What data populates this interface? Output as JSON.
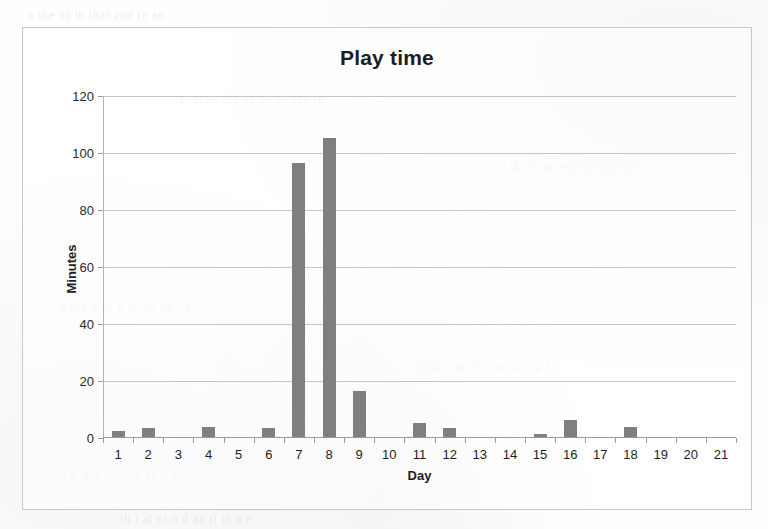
{
  "chart_data": {
    "type": "bar",
    "title": "Play time",
    "xlabel": "Day",
    "ylabel": "Minutes",
    "categories": [
      "1",
      "2",
      "3",
      "4",
      "5",
      "6",
      "7",
      "8",
      "9",
      "10",
      "11",
      "12",
      "13",
      "14",
      "15",
      "16",
      "17",
      "18",
      "19",
      "20",
      "21"
    ],
    "values": [
      2,
      3,
      0,
      3.5,
      0,
      3,
      96,
      105,
      16,
      0,
      5,
      3,
      0,
      0,
      1,
      6,
      0,
      3.5,
      0,
      0,
      0
    ],
    "ylim": [
      0,
      120
    ],
    "yticks": [
      0,
      20,
      40,
      60,
      80,
      100,
      120
    ],
    "ytick_labels": [
      "0",
      "20",
      "40",
      "60",
      "80",
      "100",
      "120"
    ],
    "grid": true,
    "legend": false,
    "legend_position": "none",
    "series": [
      {
        "name": "Play time",
        "color": "#7f7f7f",
        "values": [
          2,
          3,
          0,
          3.5,
          0,
          3,
          96,
          105,
          16,
          0,
          5,
          3,
          0,
          0,
          1,
          6,
          0,
          3.5,
          0,
          0,
          0
        ]
      }
    ]
  },
  "colors": {
    "bar": "#7f7f7f",
    "gridline": "#c6c6c6",
    "axis": "#9a9a9a",
    "frame": "#c8c8c8",
    "text": "#1d1d1d",
    "page": "#fefefe"
  },
  "scan_artifacts": {
    "ghost_lines": [
      "a   the  of  in   that  and   re  an",
      "to   it  of   the   an  of  on  the   in",
      "e  th  of  an    te  ni   a  in  te   lo",
      "n  the   a  so   e  mi   ol  an   i  a",
      "in  a  o   m  th  ti   en  il   o  a  l",
      "o   ia  n  th   e  a  ut  th   an  o  e",
      "th  i  al   ni  o  d  an  ti  in  a  e"
    ]
  }
}
